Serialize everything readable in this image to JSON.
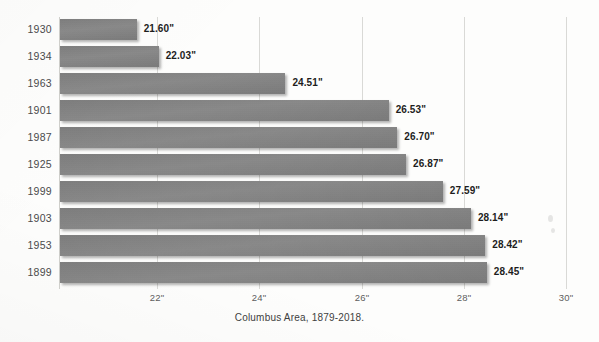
{
  "chart_data": {
    "type": "bar",
    "orientation": "horizontal",
    "title": "",
    "caption": "Columbus Area, 1879-2018.",
    "xlabel": "",
    "ylabel": "",
    "categories": [
      "1930",
      "1934",
      "1963",
      "1901",
      "1987",
      "1925",
      "1999",
      "1903",
      "1953",
      "1899"
    ],
    "values": [
      21.6,
      22.03,
      24.51,
      26.53,
      26.7,
      26.87,
      27.59,
      28.14,
      28.42,
      28.45
    ],
    "value_labels": [
      "21.60\"",
      "22.03\"",
      "24.51\"",
      "26.53\"",
      "26.70\"",
      "26.87\"",
      "27.59\"",
      "28.14\"",
      "28.42\"",
      "28.45\""
    ],
    "xticks": [
      22,
      24,
      26,
      28,
      30
    ],
    "xtick_labels": [
      "22\"",
      "24\"",
      "26\"",
      "28\"",
      "30\""
    ],
    "xlim": [
      20.1,
      30.0
    ],
    "grid": true,
    "legend": "none",
    "bar_color": "#808080",
    "label_color": "#1d1d1d",
    "gridline_color": "#d9d9d6",
    "background_color": "#fdfdfc",
    "units": "inches"
  },
  "axis": {
    "tick_0": "22\"",
    "tick_1": "24\"",
    "tick_2": "26\"",
    "tick_3": "28\"",
    "tick_4": "30\""
  },
  "rows": [
    {
      "year": "1930",
      "label": "21.60\""
    },
    {
      "year": "1934",
      "label": "22.03\""
    },
    {
      "year": "1963",
      "label": "24.51\""
    },
    {
      "year": "1901",
      "label": "26.53\""
    },
    {
      "year": "1987",
      "label": "26.70\""
    },
    {
      "year": "1925",
      "label": "26.87\""
    },
    {
      "year": "1999",
      "label": "27.59\""
    },
    {
      "year": "1903",
      "label": "28.14\""
    },
    {
      "year": "1953",
      "label": "28.42\""
    },
    {
      "year": "1899",
      "label": "28.45\""
    }
  ],
  "caption": {
    "text": "Columbus Area, 1879-2018."
  }
}
